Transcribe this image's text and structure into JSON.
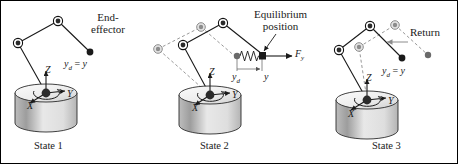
{
  "figure": {
    "width": 458,
    "height": 164,
    "background": "#ffffff",
    "border_color": "#000000"
  },
  "colors": {
    "line": "#1a1a1a",
    "ghost": "#8c8c8c",
    "joint_fill": "#3a3a3a",
    "joint_ring": "#111111",
    "cylinder_light": "#f2f2f2",
    "cylinder_mid": "#d8d8d8",
    "cylinder_dark": "#9a9a9a",
    "text": "#1a1a1a"
  },
  "panels": [
    {
      "id": "state-1",
      "caption": "State 1",
      "caption_pos": {
        "x": 32,
        "y": 141
      },
      "callouts": [
        {
          "name": "end-effector-label",
          "lines": [
            "End-",
            "effector"
          ],
          "x": 90,
          "y": 11
        }
      ],
      "math_labels": [
        {
          "name": "yd-equals-y-label",
          "base": "y",
          "sub": "d",
          "eq": " = ",
          "var": "y",
          "x": 66,
          "y": 60
        }
      ],
      "axes": [
        {
          "name": "axis-label-z",
          "text": "Z",
          "x": 44,
          "y": 67
        },
        {
          "name": "axis-label-y",
          "text": "Y",
          "x": 66,
          "y": 95
        },
        {
          "name": "axis-label-x",
          "text": "X",
          "x": 27,
          "y": 105
        }
      ]
    },
    {
      "id": "state-2",
      "caption": "State 2",
      "caption_pos": {
        "x": 198,
        "y": 141
      },
      "callouts": [
        {
          "name": "equilibrium-position-label",
          "lines": [
            "Equilibrium",
            "position"
          ],
          "x": 255,
          "y": 8
        }
      ],
      "math_labels": [
        {
          "name": "force-fy-label",
          "base": "F",
          "sub": "y",
          "eq": "",
          "var": "",
          "x": 296,
          "y": 54
        },
        {
          "name": "yd-label",
          "base": "y",
          "sub": "d",
          "eq": "",
          "var": "",
          "x": 233,
          "y": 74
        },
        {
          "name": "y-label",
          "base": "y",
          "sub": "",
          "eq": "",
          "var": "",
          "x": 265,
          "y": 74
        }
      ],
      "axes": [
        {
          "name": "axis-label-z",
          "text": "Z",
          "x": 208,
          "y": 69
        },
        {
          "name": "axis-label-y",
          "text": "Y",
          "x": 231,
          "y": 96
        },
        {
          "name": "axis-label-x",
          "text": "X",
          "x": 192,
          "y": 107
        }
      ]
    },
    {
      "id": "state-3",
      "caption": "State 3",
      "caption_pos": {
        "x": 372,
        "y": 141
      },
      "callouts": [
        {
          "name": "return-label",
          "lines": [
            "Return"
          ],
          "x": 412,
          "y": 30
        }
      ],
      "math_labels": [
        {
          "name": "yd-equals-y-label",
          "base": "y",
          "sub": "d",
          "eq": " = ",
          "var": "y",
          "x": 383,
          "y": 68
        }
      ],
      "axes": [
        {
          "name": "axis-label-z",
          "text": "Z",
          "x": 364,
          "y": 76
        },
        {
          "name": "axis-label-y",
          "text": "Y",
          "x": 387,
          "y": 101
        },
        {
          "name": "axis-label-x",
          "text": "X",
          "x": 348,
          "y": 113
        }
      ]
    }
  ],
  "geometry": {
    "state1": {
      "base": {
        "cx": 45,
        "cy": 92,
        "rx": 31,
        "ry": 9,
        "height": 30
      },
      "joints": [
        [
          45,
          92
        ],
        [
          17,
          42
        ],
        [
          57,
          20
        ]
      ],
      "end_effector": [
        89,
        51
      ],
      "links": [
        [
          [
            45,
            92
          ],
          [
            17,
            42
          ]
        ],
        [
          [
            17,
            42
          ],
          [
            57,
            20
          ]
        ],
        [
          [
            57,
            20
          ],
          [
            89,
            51
          ]
        ]
      ]
    },
    "state2": {
      "base": {
        "cx": 209,
        "cy": 94,
        "rx": 31,
        "ry": 9,
        "height": 30
      },
      "joints": [
        [
          209,
          94
        ],
        [
          182,
          44
        ],
        [
          222,
          22
        ]
      ],
      "end_effector": [
        261,
        55
      ],
      "ghost_joints": [
        [
          157,
          48
        ],
        [
          200,
          26
        ]
      ],
      "ghost_end_effector": [
        236,
        57
      ],
      "spring": {
        "x1": 238,
        "x2": 259,
        "y": 55,
        "coils": 6
      },
      "force_arrow": {
        "x1": 263,
        "x2": 291,
        "y": 55
      },
      "dimension": {
        "x1": 236,
        "x2": 261,
        "y": 68
      }
    },
    "state3": {
      "base": {
        "cx": 366,
        "cy": 99,
        "rx": 31,
        "ry": 9,
        "height": 30
      },
      "joints": [
        [
          366,
          99
        ],
        [
          338,
          49
        ],
        [
          369,
          25
        ]
      ],
      "end_effector": [
        401,
        57
      ],
      "ghost_joints": [
        [
          358,
          46
        ],
        [
          394,
          24
        ]
      ],
      "ghost_end_effector": [
        427,
        54
      ],
      "return_arrow": {
        "x1": 404,
        "x2": 385,
        "y": 41
      }
    }
  }
}
